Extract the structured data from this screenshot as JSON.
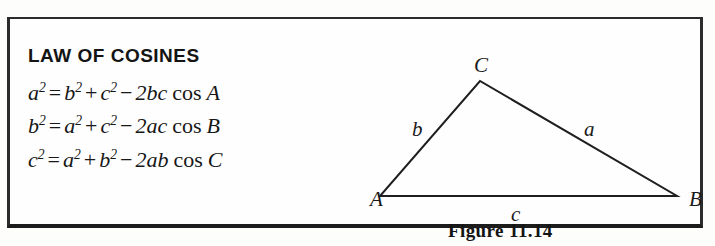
{
  "box": {
    "title": "LAW OF COSINES",
    "formulas": [
      {
        "lhs_base": "a",
        "lhs_exp": "2",
        "eq": "=",
        "t1_base": "b",
        "t1_exp": "2",
        "plus": "+",
        "t2_base": "c",
        "t2_exp": "2",
        "minus": "−",
        "coef": "2",
        "prod": "bc",
        "cos": "cos",
        "angle": "A",
        "text": "a² = b² + c² − 2bc cos A"
      },
      {
        "lhs_base": "b",
        "lhs_exp": "2",
        "eq": "=",
        "t1_base": "a",
        "t1_exp": "2",
        "plus": "+",
        "t2_base": "c",
        "t2_exp": "2",
        "minus": "−",
        "coef": "2",
        "prod": "ac",
        "cos": "cos",
        "angle": "B",
        "text": "b² = a² + c² − 2ac cos B"
      },
      {
        "lhs_base": "c",
        "lhs_exp": "2",
        "eq": "=",
        "t1_base": "a",
        "t1_exp": "2",
        "plus": "+",
        "t2_base": "b",
        "t2_exp": "2",
        "minus": "−",
        "coef": "2",
        "prod": "ab",
        "cos": "cos",
        "angle": "C",
        "text": "c² = a² + b² − 2ab cos C"
      }
    ]
  },
  "figure": {
    "caption": "Figure 11.14",
    "vertices": {
      "A": "A",
      "B": "B",
      "C": "C"
    },
    "sides": {
      "a": "a",
      "b": "b",
      "c": "c"
    },
    "geometry": {
      "A_point": "18,157",
      "B_point": "315,157",
      "C_point": "118,42",
      "stroke": "#1f1f1f",
      "stroke_width": "2"
    }
  },
  "colors": {
    "border": "#2b2b2b",
    "ink": "#171717",
    "paper": "#fefefe"
  }
}
